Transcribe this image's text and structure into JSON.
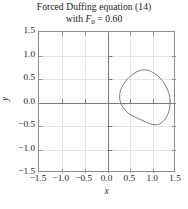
{
  "chart_data": {
    "type": "line",
    "title": "Forced Duffing equation (14)",
    "subtitle_prefix": "with ",
    "subtitle_symbol": "F",
    "subtitle_subscript": "0",
    "subtitle_equals": " = 0.60",
    "subtitle_full": "with F0 = 0.60",
    "xlabel": "x",
    "ylabel": "y",
    "xlim": [
      -1.5,
      1.5
    ],
    "ylim": [
      -1.5,
      1.5
    ],
    "xticks": [
      -1.5,
      -1.0,
      -0.5,
      0.0,
      0.5,
      1.0,
      1.5
    ],
    "yticks": [
      -1.5,
      -1.0,
      -0.5,
      0.0,
      0.5,
      1.0,
      1.5
    ],
    "xticklabels": [
      "−1.5",
      "−1.0",
      "−0.5",
      "0.0",
      "0.5",
      "1.0",
      "1.5"
    ],
    "yticklabels": [
      "−1.5",
      "−1.0",
      "−0.5",
      "0.0",
      "0.5",
      "1.0",
      "1.5"
    ],
    "grid": true,
    "grid_color": "#d9d9d9",
    "axis_line_color": "#6e6e6e",
    "frame_color": "#8a8a8a",
    "legend": null,
    "series": [
      {
        "name": "limit cycle orbit",
        "closed": true,
        "color": "#6b6b6b",
        "linewidth": 0.9,
        "points": [
          [
            1.37,
            0.03
          ],
          [
            1.362,
            0.11
          ],
          [
            1.344,
            0.19
          ],
          [
            1.318,
            0.266
          ],
          [
            1.285,
            0.338
          ],
          [
            1.246,
            0.404
          ],
          [
            1.201,
            0.466
          ],
          [
            1.15,
            0.522
          ],
          [
            1.094,
            0.572
          ],
          [
            1.034,
            0.615
          ],
          [
            0.972,
            0.65
          ],
          [
            0.92,
            0.678
          ],
          [
            0.866,
            0.692
          ],
          [
            0.81,
            0.696
          ],
          [
            0.752,
            0.69
          ],
          [
            0.694,
            0.674
          ],
          [
            0.636,
            0.65
          ],
          [
            0.58,
            0.618
          ],
          [
            0.526,
            0.58
          ],
          [
            0.474,
            0.536
          ],
          [
            0.426,
            0.488
          ],
          [
            0.382,
            0.436
          ],
          [
            0.344,
            0.38
          ],
          [
            0.312,
            0.322
          ],
          [
            0.288,
            0.262
          ],
          [
            0.272,
            0.2
          ],
          [
            0.266,
            0.138
          ],
          [
            0.268,
            0.076
          ],
          [
            0.28,
            0.016
          ],
          [
            0.302,
            -0.042
          ],
          [
            0.334,
            -0.098
          ],
          [
            0.374,
            -0.15
          ],
          [
            0.422,
            -0.198
          ],
          [
            0.476,
            -0.24
          ],
          [
            0.536,
            -0.278
          ],
          [
            0.6,
            -0.31
          ],
          [
            0.666,
            -0.34
          ],
          [
            0.734,
            -0.37
          ],
          [
            0.802,
            -0.4
          ],
          [
            0.868,
            -0.428
          ],
          [
            0.93,
            -0.452
          ],
          [
            0.99,
            -0.468
          ],
          [
            1.046,
            -0.474
          ],
          [
            1.098,
            -0.47
          ],
          [
            1.146,
            -0.454
          ],
          [
            1.19,
            -0.428
          ],
          [
            1.23,
            -0.392
          ],
          [
            1.266,
            -0.348
          ],
          [
            1.298,
            -0.298
          ],
          [
            1.324,
            -0.242
          ],
          [
            1.344,
            -0.184
          ],
          [
            1.358,
            -0.124
          ],
          [
            1.367,
            -0.062
          ],
          [
            1.37,
            0.03
          ]
        ]
      }
    ]
  }
}
